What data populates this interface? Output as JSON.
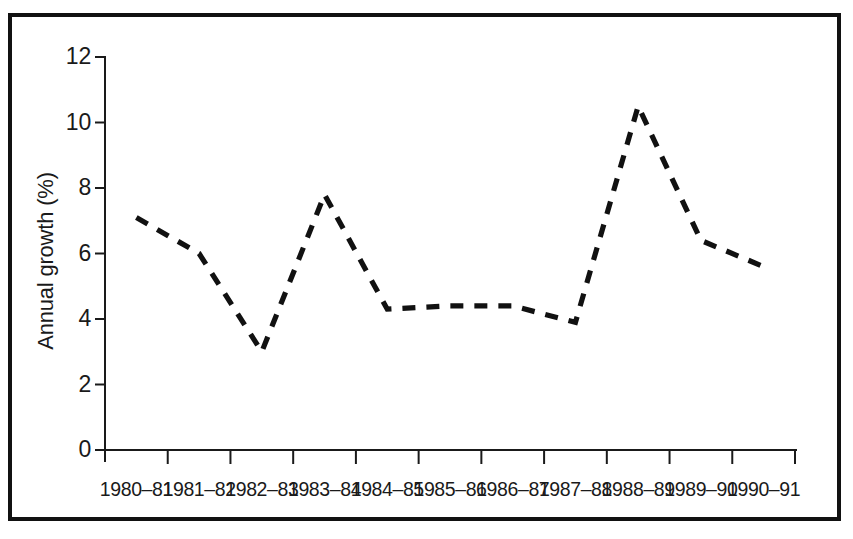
{
  "chart_data": {
    "type": "line",
    "title": "",
    "subtitle": "",
    "xlabel": "",
    "ylabel": "Annual growth (%)",
    "categories": [
      "1980–81",
      "1981–82",
      "1982–83",
      "1983–84",
      "1984–85",
      "1985–86",
      "1986–87",
      "1987–88",
      "1988–89",
      "1989–90",
      "1990–91"
    ],
    "values": [
      7.1,
      6.0,
      3.0,
      7.8,
      4.3,
      4.4,
      4.4,
      3.9,
      10.5,
      6.4,
      5.6
    ],
    "series": [
      {
        "name": "Annual growth",
        "values": [
          7.1,
          6.0,
          3.0,
          7.8,
          4.3,
          4.4,
          4.4,
          3.9,
          10.5,
          6.4,
          5.6
        ],
        "style": "dashed",
        "color": "#111111"
      }
    ],
    "ylim": [
      0,
      12
    ],
    "yticks": [
      0,
      2,
      4,
      6,
      8,
      10,
      12
    ],
    "ytick_labels": [
      "0",
      "2",
      "4",
      "6",
      "8",
      "10",
      "12"
    ],
    "grid": false,
    "legend": false,
    "legend_position": "none",
    "annotations": []
  },
  "figure": {
    "border_color": "#111111",
    "background_color": "#ffffff",
    "line_color": "#111111",
    "axis_color": "#1a1a1a"
  }
}
